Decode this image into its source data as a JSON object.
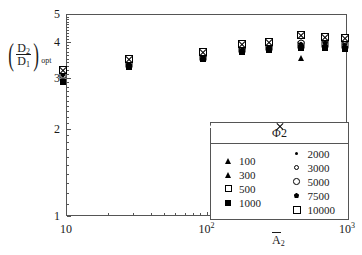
{
  "chart_data": {
    "type": "scatter",
    "title": "",
    "xlabel": "A̅2",
    "ylabel": "(D2/D1)opt",
    "xscale": "log",
    "yscale": "log",
    "xlim": [
      10,
      1000
    ],
    "ylim": [
      1,
      5
    ],
    "xticks": [
      10,
      100,
      1000
    ],
    "xtick_labels": [
      "10",
      "10",
      "10"
    ],
    "xtick_exponents": [
      "",
      "2",
      "3"
    ],
    "yticks": [
      1,
      2,
      3,
      4,
      5
    ],
    "ytick_labels": [
      "1",
      "2",
      "3",
      "4",
      "5"
    ],
    "grid": false,
    "legend_position": "lower right",
    "legend_title": "Φ2",
    "series": [
      {
        "name": "100",
        "marker": "triangle-open",
        "x": [
          9.5,
          28,
          95,
          180,
          280,
          470,
          700,
          960
        ],
        "y": [
          3.15,
          3.4,
          3.62,
          3.85,
          3.9,
          4.0,
          4.05,
          4.1
        ]
      },
      {
        "name": "300",
        "marker": "triangle-filled",
        "x": [
          9.5,
          28,
          95,
          180,
          280,
          470,
          700,
          960
        ],
        "y": [
          3.0,
          3.3,
          3.5,
          3.72,
          3.78,
          3.52,
          3.85,
          3.8
        ]
      },
      {
        "name": "500",
        "marker": "square-open",
        "x": [
          9.5,
          28,
          95,
          180,
          280,
          470,
          700,
          960
        ],
        "y": [
          3.08,
          3.35,
          3.55,
          3.78,
          3.84,
          3.9,
          3.95,
          3.92
        ]
      },
      {
        "name": "1000",
        "marker": "square-filled",
        "x": [
          9.5,
          28,
          95,
          180,
          280,
          470,
          700,
          960
        ],
        "y": [
          2.9,
          3.28,
          3.48,
          3.7,
          3.76,
          3.82,
          3.8,
          3.78
        ]
      },
      {
        "name": "2000",
        "marker": "dot-filled",
        "x": [
          9.5,
          28,
          95,
          180,
          280,
          470,
          700,
          960
        ],
        "y": [
          3.05,
          3.33,
          3.53,
          3.75,
          3.82,
          3.88,
          3.9,
          3.86
        ]
      },
      {
        "name": "3000",
        "marker": "circle-tiny",
        "x": [
          9.5,
          28,
          95,
          180,
          280,
          470,
          700,
          960
        ],
        "y": [
          3.12,
          3.38,
          3.58,
          3.8,
          3.88,
          3.95,
          4.0,
          3.98
        ]
      },
      {
        "name": "5000",
        "marker": "circle-open",
        "x": [
          9.5,
          28,
          95,
          180,
          280,
          470,
          700,
          960
        ],
        "y": [
          3.16,
          3.42,
          3.6,
          3.83,
          3.92,
          3.98,
          4.08,
          4.05
        ]
      },
      {
        "name": "7500",
        "marker": "diamond-filled",
        "x": [
          9.5,
          28,
          95,
          180,
          280,
          470,
          700,
          960
        ],
        "y": [
          3.1,
          3.36,
          3.56,
          3.77,
          3.85,
          3.93,
          3.97,
          3.9
        ]
      },
      {
        "name": "10000",
        "marker": "square-crossed",
        "x": [
          9.5,
          28,
          95,
          180,
          280,
          470,
          700,
          960
        ],
        "y": [
          3.2,
          3.5,
          3.7,
          3.95,
          4.0,
          4.22,
          4.15,
          4.12
        ]
      }
    ]
  },
  "axes": {
    "y_title": {
      "numerator": "D",
      "numerator_sub": "2",
      "denominator": "D",
      "denominator_sub": "1",
      "subscript": "opt",
      "paren_open": "(",
      "paren_close": ")"
    },
    "x_title": {
      "base": "A",
      "sub": "2"
    }
  },
  "legend": {
    "title": "Φ2",
    "columns": [
      {
        "items": [
          {
            "label": "100",
            "marker": "triangle-open"
          },
          {
            "label": "300",
            "marker": "triangle-filled"
          },
          {
            "label": "500",
            "marker": "square-open"
          },
          {
            "label": "1000",
            "marker": "square-filled"
          }
        ]
      },
      {
        "items": [
          {
            "label": "2000",
            "marker": "dot-filled"
          },
          {
            "label": "3000",
            "marker": "circle-tiny"
          },
          {
            "label": "5000",
            "marker": "circle-open"
          },
          {
            "label": "7500",
            "marker": "diamond-filled"
          },
          {
            "label": "10000",
            "marker": "square-crossed"
          }
        ]
      }
    ]
  }
}
